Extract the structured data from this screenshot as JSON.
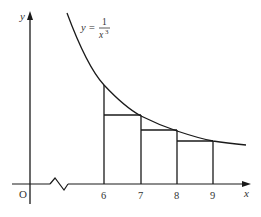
{
  "diagram": {
    "type": "graph",
    "function_label": {
      "lhs": "y =",
      "numerator": "1",
      "denominator": "x",
      "exponent": "3"
    },
    "axes": {
      "x_label": "x",
      "y_label": "y",
      "origin_label": "O"
    },
    "x_ticks": [
      "6",
      "7",
      "8",
      "9"
    ],
    "rectangles": [
      {
        "from": 6,
        "to": 7,
        "height_at": 7
      },
      {
        "from": 7,
        "to": 8,
        "height_at": 8
      },
      {
        "from": 8,
        "to": 9,
        "height_at": 9
      }
    ],
    "axis_break": true,
    "colors": {
      "line": "#1a1a1a",
      "text": "#333333"
    }
  }
}
